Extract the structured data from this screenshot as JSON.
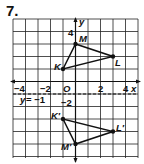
{
  "problem_number": "7.",
  "graph": {
    "x_range": [
      -5,
      5
    ],
    "y_range": [
      -6,
      5
    ],
    "x_tick_labels": [
      "−4",
      "−2",
      "O",
      "2",
      "4"
    ],
    "x_axis_label": "x",
    "y_axis_label": "y",
    "y_tick_labels": [
      "4",
      "−2"
    ],
    "line_of_reflection": "y = −1",
    "original": {
      "K": [
        -1,
        1
      ],
      "M": [
        0,
        3
      ],
      "L": [
        3,
        2
      ]
    },
    "image": {
      "K'": [
        -1,
        -3
      ],
      "M'": [
        0,
        -5
      ],
      "L'": [
        3,
        -4
      ]
    },
    "labels": {
      "K": "K",
      "M": "M",
      "L": "L",
      "Kp": "K′",
      "Mp": "M′",
      "Lp": "L′"
    }
  }
}
